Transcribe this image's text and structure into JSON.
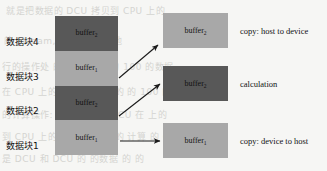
{
  "figure": {
    "colors": {
      "background": "#f6f6f4",
      "dark_block": "#585858",
      "light_block": "#a8a8a8",
      "arrow": "#1a1a1a",
      "text": "#111111"
    }
  },
  "stack": {
    "blocks": [
      {
        "cn_label": "数据块4",
        "buffer_text": "buffer",
        "buffer_subscript": "2",
        "shade": "dark"
      },
      {
        "cn_label": "数据块3",
        "buffer_text": "buffer",
        "buffer_subscript": "1",
        "shade": "light"
      },
      {
        "cn_label": "数据块2",
        "buffer_text": "buffer",
        "buffer_subscript": "2",
        "shade": "dark"
      },
      {
        "cn_label": "数据块1",
        "buffer_text": "buffer",
        "buffer_subscript": "1",
        "shade": "light"
      }
    ]
  },
  "stages": [
    {
      "buffer_text": "buffer",
      "buffer_subscript": "2",
      "caption": "copy: host to device",
      "shade": "light"
    },
    {
      "buffer_text": "buffer",
      "buffer_subscript": "2",
      "caption": "calculation",
      "shade": "dark"
    },
    {
      "buffer_text": "buffer",
      "buffer_subscript": "1",
      "caption": "copy: device to host",
      "shade": "light"
    }
  ],
  "bleed_through": [
    {
      "text": "就是把数据的 DCU 拷贝到 CPU 上的"
    },
    {
      "text": "的 Stream, 的内存 的 其他"
    },
    {
      "text": "行的操作处 的 上的 拷贝 的 100 的数据"
    },
    {
      "text": "在 CPU 上的数据 的 计算 的 的 100 的数据"
    },
    {
      "text": "的计算操作: 分别 是数据 DCU 在 上的"
    },
    {
      "text": "到 CPU 上的数据 的 分别 的 计算 的 CPU"
    },
    {
      "text": "是 DCU 和 DCU 的 的数据 的 的"
    }
  ]
}
